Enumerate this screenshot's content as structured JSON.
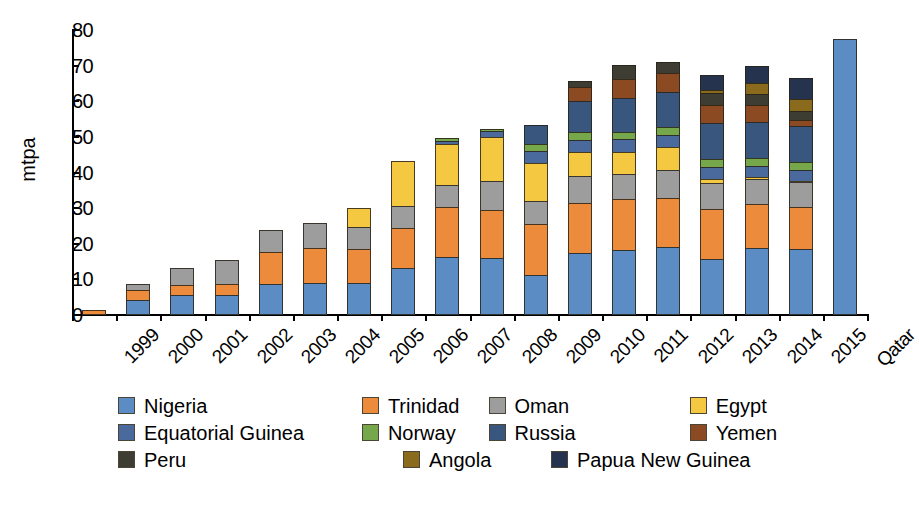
{
  "chart_data": {
    "type": "bar",
    "subtype": "stacked-bar",
    "title": "",
    "xlabel": "",
    "ylabel": "mtpa",
    "ylim": [
      0,
      80
    ],
    "yticks": [
      0,
      10,
      20,
      30,
      40,
      50,
      60,
      70,
      80
    ],
    "grid": false,
    "legend_position": "bottom",
    "categories": [
      "1999",
      "2000",
      "2001",
      "2002",
      "2003",
      "2004",
      "2005",
      "2006",
      "2007",
      "2008",
      "2009",
      "2010",
      "2011",
      "2012",
      "2013",
      "2014",
      "2015",
      "Qatar"
    ],
    "series": [
      {
        "name": "Nigeria",
        "color": "#5B8CC4",
        "values": [
          0,
          4.3,
          5.6,
          5.7,
          8.6,
          9.1,
          9.0,
          13.1,
          16.2,
          16.1,
          11.2,
          17.4,
          18.3,
          19.0,
          15.7,
          18.8,
          18.6,
          77.5
        ]
      },
      {
        "name": "Trinidad",
        "color": "#ED8B3C",
        "values": [
          1.5,
          3.1,
          3.0,
          3.2,
          9.3,
          9.9,
          9.9,
          11.7,
          14.3,
          13.6,
          14.7,
          14.4,
          14.5,
          14.0,
          14.3,
          12.6,
          12.0,
          0
        ]
      },
      {
        "name": "Oman",
        "color": "#9D9D9D",
        "values": [
          0,
          1.9,
          5.2,
          7.0,
          6.4,
          7.3,
          6.4,
          6.4,
          6.7,
          8.4,
          6.8,
          7.9,
          7.3,
          8.4,
          7.7,
          7.3,
          7.2,
          0
        ]
      },
      {
        "name": "Egypt",
        "color": "#F5C842",
        "values": [
          0,
          0,
          0,
          0,
          0,
          0,
          5.7,
          12.9,
          11.6,
          12.6,
          10.7,
          6.9,
          6.6,
          6.6,
          1.4,
          0.8,
          0.5,
          0
        ]
      },
      {
        "name": "Equatorial Guinea",
        "color": "#4A6A9E",
        "values": [
          0,
          0,
          0,
          0,
          0,
          0,
          0,
          0,
          1.3,
          2.0,
          3.7,
          3.7,
          3.7,
          3.7,
          3.7,
          3.6,
          3.6,
          0
        ]
      },
      {
        "name": "Norway",
        "color": "#76A84B",
        "values": [
          0,
          0,
          0,
          0,
          0,
          0,
          0,
          0,
          1.0,
          0.8,
          2.2,
          2.4,
          2.5,
          2.6,
          2.5,
          2.5,
          2.5,
          0
        ]
      },
      {
        "name": "Russia",
        "color": "#39567F",
        "values": [
          0,
          0,
          0,
          0,
          0,
          0,
          0,
          0,
          0,
          0,
          5.8,
          9.2,
          9.8,
          10.0,
          10.2,
          10.4,
          10.2,
          0
        ]
      },
      {
        "name": "Yemen",
        "color": "#8C4A22",
        "values": [
          0,
          0,
          0,
          0,
          0,
          0,
          0,
          0,
          0,
          0,
          0,
          4.0,
          5.6,
          5.5,
          5.4,
          4.8,
          2.1,
          0
        ]
      },
      {
        "name": "Peru",
        "color": "#3D3D33",
        "values": [
          0,
          0,
          0,
          0,
          0,
          0,
          0,
          0,
          0,
          0,
          0,
          2.0,
          4.2,
          3.6,
          3.8,
          3.4,
          2.9,
          0
        ]
      },
      {
        "name": "Angola",
        "color": "#8A6B1E",
        "values": [
          0,
          0,
          0,
          0,
          0,
          0,
          0,
          0,
          0,
          0,
          0,
          0,
          0,
          0,
          1.0,
          3.4,
          3.4,
          0
        ]
      },
      {
        "name": "Papua New Guinea",
        "color": "#26334F",
        "values": [
          0,
          0,
          0,
          0,
          0,
          0,
          0,
          0,
          0,
          0,
          0,
          0,
          0,
          0,
          4.5,
          5.0,
          6.2,
          0
        ]
      }
    ],
    "totals": [
      1.5,
      9.3,
      13.8,
      15.9,
      24.3,
      26.3,
      31.0,
      44.1,
      51.1,
      53.5,
      55.1,
      67.9,
      72.5,
      73.4,
      70.2,
      72.6,
      69.2,
      77.5
    ]
  },
  "legend": {
    "rows": [
      [
        {
          "label": "Nigeria",
          "color": "#5B8CC4"
        },
        {
          "label": "Trinidad",
          "color": "#ED8B3C"
        },
        {
          "label": "Oman",
          "color": "#9D9D9D"
        },
        {
          "label": "Egypt",
          "color": "#F5C842"
        }
      ],
      [
        {
          "label": "Equatorial Guinea",
          "color": "#4A6A9E"
        },
        {
          "label": "Norway",
          "color": "#76A84B"
        },
        {
          "label": "Russia",
          "color": "#39567F"
        },
        {
          "label": "Yemen",
          "color": "#8C4A22"
        }
      ],
      [
        {
          "label": "Peru",
          "color": "#3D3D33"
        },
        {
          "label": "Angola",
          "color": "#8A6B1E"
        },
        {
          "label": "Papua New Guinea",
          "color": "#26334F"
        }
      ]
    ]
  }
}
